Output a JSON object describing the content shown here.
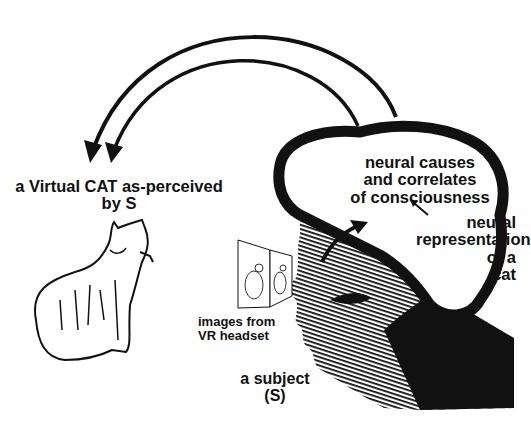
{
  "diagram": {
    "type": "illustration",
    "theme": "virtual reality perception and neural correlates of consciousness",
    "labels": {
      "virtual_cat": [
        "a Virtual CAT as-perceived",
        "by S"
      ],
      "neural_causes": [
        "neural causes",
        "and correlates",
        "of consciousness"
      ],
      "neural_representation": [
        "neural",
        "representation",
        "of a",
        "cat"
      ],
      "images_from_headset": [
        "images from",
        "VR headset"
      ],
      "subject": [
        "a subject",
        "(S)"
      ]
    },
    "faint_caption": "",
    "elements": {
      "arrows": [
        {
          "id": "outer-projection-arrow",
          "from": "brain",
          "to": "virtual-cat",
          "style": "curved"
        },
        {
          "id": "inner-projection-arrow",
          "from": "brain",
          "to": "virtual-cat",
          "style": "curved"
        },
        {
          "id": "headset-to-brain-arrow",
          "from": "eyes",
          "to": "neural-representation",
          "style": "curved"
        },
        {
          "id": "representation-to-consciousness-arrow",
          "from": "neural-representation",
          "to": "neural-causes",
          "style": "straight"
        }
      ],
      "figures": [
        "cat-drawing",
        "head-profile",
        "brain-outline",
        "vr-headset-panels"
      ]
    },
    "colors": {
      "ink": "#111111",
      "background": "#ffffff"
    }
  }
}
